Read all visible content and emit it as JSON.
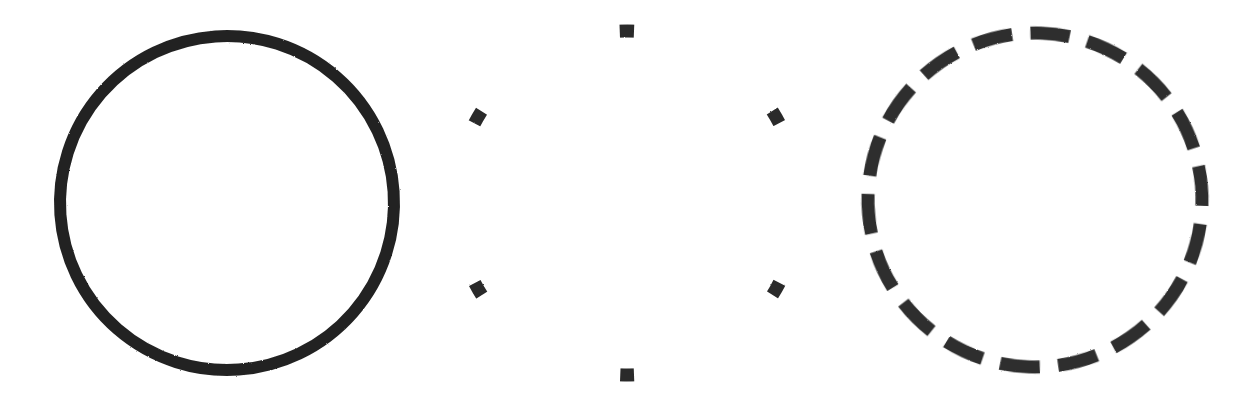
{
  "canvas": {
    "width": 1258,
    "height": 408,
    "background_color": "#ffffff",
    "ink_color": "#262626"
  },
  "figure": {
    "title": "",
    "shape_count": 3,
    "shape_kind": "circle-outline"
  },
  "shapes": [
    {
      "id": "circle-solid",
      "name": "solid-circle",
      "stroke_style": "solid",
      "cx": 227,
      "cy": 203,
      "r": 167,
      "stroke_width": 12,
      "stroke_color": "#232323",
      "dash_pattern": "",
      "dash_offset": 0,
      "rotation": -4
    },
    {
      "id": "circle-sparse-dotted",
      "name": "sparse-dashed-circle",
      "stroke_style": "sparse-dashed",
      "cx": 627,
      "cy": 203,
      "r": 172,
      "stroke_width": 13,
      "stroke_color": "#2b2b2b",
      "dash_pattern": "14 166",
      "dash_offset": 7,
      "rotation": -90,
      "dash_count": 6
    },
    {
      "id": "circle-dashed",
      "name": "dashed-circle",
      "stroke_style": "dashed",
      "cx": 1035,
      "cy": 200,
      "r": 167,
      "stroke_width": 13,
      "stroke_color": "#2f2f2f",
      "dash_pattern": "40 18.3",
      "dash_offset": 11,
      "rotation": -88,
      "dash_count": 18
    }
  ],
  "labels": {
    "solid": "",
    "sparse": "",
    "dashed": ""
  }
}
